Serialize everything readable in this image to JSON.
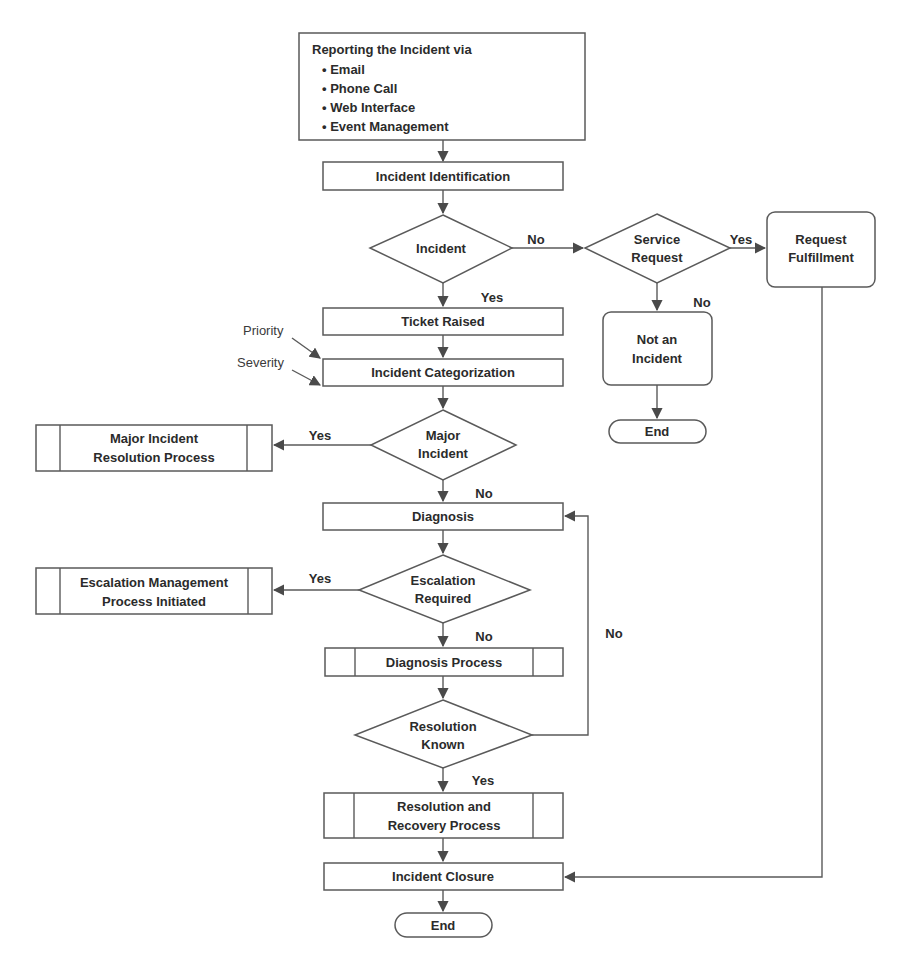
{
  "diagram": {
    "type": "flowchart",
    "colors": {
      "stroke": "#5a5a5a",
      "text": "#2b2b2b",
      "background": "#ffffff"
    },
    "nodes": {
      "reporting": {
        "title": "Reporting the Incident via",
        "items": [
          "• Email",
          "• Phone Call",
          "• Web Interface",
          "• Event Management"
        ]
      },
      "identification": {
        "label": "Incident Identification"
      },
      "incident_decision": {
        "label": "Incident"
      },
      "service_request_decision": {
        "line1": "Service",
        "line2": "Request"
      },
      "request_fulfillment": {
        "line1": "Request",
        "line2": "Fulfillment"
      },
      "not_incident": {
        "line1": "Not an",
        "line2": "Incident"
      },
      "end_right": {
        "label": "End"
      },
      "ticket_raised": {
        "label": "Ticket Raised"
      },
      "categorization": {
        "label": "Incident Categorization"
      },
      "priority_note": {
        "label": "Priority"
      },
      "severity_note": {
        "label": "Severity"
      },
      "major_incident_decision": {
        "line1": "Major",
        "line2": "Incident"
      },
      "major_incident_process": {
        "line1": "Major Incident",
        "line2": "Resolution Process"
      },
      "diagnosis": {
        "label": "Diagnosis"
      },
      "escalation_decision": {
        "line1": "Escalation",
        "line2": "Required"
      },
      "escalation_process": {
        "line1": "Escalation Management",
        "line2": "Process Initiated"
      },
      "diagnosis_process": {
        "label": "Diagnosis Process"
      },
      "resolution_known_decision": {
        "line1": "Resolution",
        "line2": "Known"
      },
      "resolution_recovery": {
        "line1": "Resolution and",
        "line2": "Recovery Process"
      },
      "closure": {
        "label": "Incident Closure"
      },
      "end_main": {
        "label": "End"
      }
    },
    "edge_labels": {
      "incident_no": "No",
      "incident_yes": "Yes",
      "service_yes": "Yes",
      "service_no": "No",
      "major_yes": "Yes",
      "major_no": "No",
      "escalation_yes": "Yes",
      "escalation_no": "No",
      "resolution_no": "No",
      "resolution_yes": "Yes"
    }
  }
}
